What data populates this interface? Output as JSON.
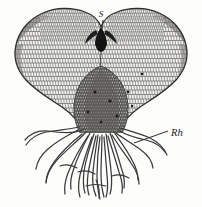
{
  "figure": {
    "background_color": "#fdfdfc",
    "ink_color": "#2b2b2b",
    "width": 202,
    "height": 207
  },
  "labels": {
    "apical_notch": {
      "text": "S",
      "x": 105,
      "y": 17,
      "points_to": "apical notch / sinus at top of heart-shaped thallus"
    },
    "rhizoids": {
      "text": "Rh",
      "x": 171,
      "y": 133,
      "points_to": "rhizoid filament",
      "leader_line": {
        "from_x": 168,
        "from_y": 131,
        "to_x": 134,
        "to_y": 143
      }
    }
  },
  "structures": [
    {
      "name": "thallus-body",
      "description": "Heart-shaped (cordate) prothallus lamina with reticulate cell network",
      "fill": "#f2f1ee",
      "stroke": "#3a3a3a"
    },
    {
      "name": "apical-notch",
      "description": "Dark V-shaped sinus at the apex between the two lobes",
      "fill": "#1c1c1c"
    },
    {
      "name": "left-lobe",
      "description": "Left wing of the cordate thallus"
    },
    {
      "name": "right-lobe",
      "description": "Right wing of the cordate thallus"
    },
    {
      "name": "central-cushion",
      "description": "Darker, thickened midrib cushion bearing archegonia",
      "fill": "#4a4a4a"
    },
    {
      "name": "rhizoid-tuft",
      "description": "Tuft of slender unicellular rhizoids projecting downward from the cushion",
      "count": 22,
      "stroke": "#3a3a3a"
    }
  ],
  "cell_network": {
    "description": "Polygonal single-layer cells rendered as a reticulate mesh across the lamina",
    "stroke": "#454545",
    "approx_rows": 26
  }
}
